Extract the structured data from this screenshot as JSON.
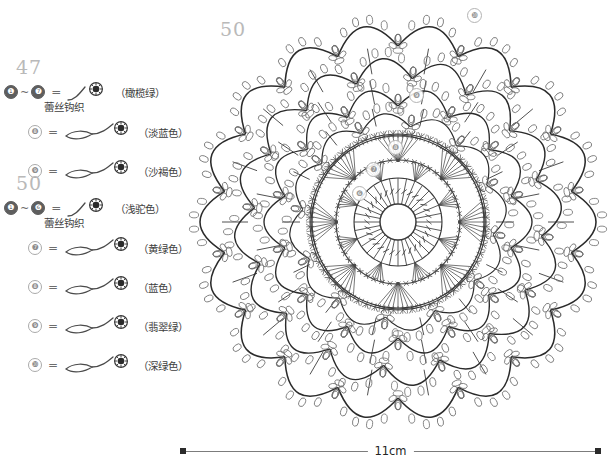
{
  "legend": {
    "groups": [
      {
        "heading": "47",
        "rows": [
          {
            "from": "❶",
            "to": "❼",
            "range": true,
            "equals": "=",
            "symbol": "short-curve-picot",
            "color_name": "（橄榄绿）",
            "note": "蕾丝钩织"
          },
          {
            "from": "❽",
            "range": false,
            "equals": "=",
            "symbol": "leaf-curve-picot",
            "color_name": "（淡蓝色）",
            "note": ""
          },
          {
            "from": "❾",
            "range": false,
            "equals": "=",
            "symbol": "leaf-curve-picot",
            "color_name": "（沙褐色）",
            "note": ""
          }
        ]
      },
      {
        "heading": "50",
        "rows": [
          {
            "from": "❶",
            "to": "❻",
            "range": true,
            "equals": "=",
            "symbol": "short-curve-picot",
            "color_name": "（浅驼色）",
            "note": "蕾丝钩织"
          },
          {
            "from": "❼",
            "range": false,
            "equals": "=",
            "symbol": "leaf-curve-picot",
            "color_name": "（黄绿色）",
            "note": ""
          },
          {
            "from": "❽",
            "range": false,
            "equals": "=",
            "symbol": "leaf-curve-picot",
            "color_name": "（蓝色）",
            "note": ""
          },
          {
            "from": "❾",
            "range": false,
            "equals": "=",
            "symbol": "leaf-curve-picot",
            "color_name": "（翡翠绿）",
            "note": ""
          },
          {
            "from": "❿",
            "range": false,
            "equals": "=",
            "symbol": "leaf-curve-picot",
            "color_name": "（深绿色）",
            "note": ""
          }
        ]
      }
    ]
  },
  "diagram": {
    "label": "50",
    "round_markers": [
      {
        "text": "❿",
        "x": 287,
        "y": 8
      },
      {
        "text": "❾",
        "x": 229,
        "y": 88
      },
      {
        "text": "❽",
        "x": 208,
        "y": 140
      },
      {
        "text": "❼",
        "x": 186,
        "y": 162
      },
      {
        "text": "❻",
        "x": 172,
        "y": 186
      }
    ]
  },
  "scale": {
    "label": "11cm"
  },
  "colors": {
    "ink": "#2b2b2b",
    "light_ink": "#8d8d8d",
    "heading_gray": "#b9b9b9"
  }
}
